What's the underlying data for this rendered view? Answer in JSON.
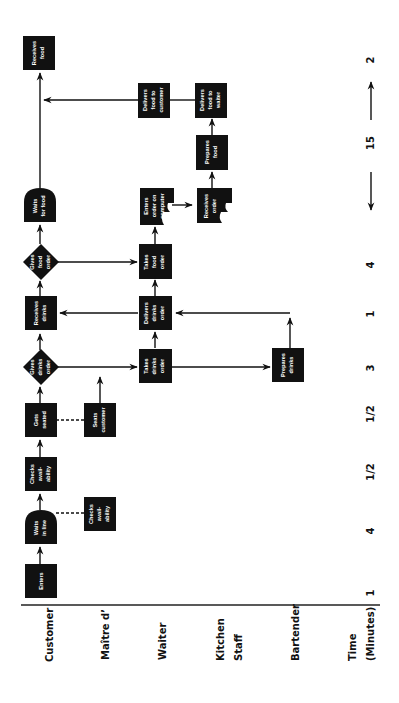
{
  "lanes": {
    "customer": "Customer",
    "maitre_d": "Maître d’",
    "waiter": "Waiter",
    "kitchen_line1": "Kitchen",
    "kitchen_line2": "Staff",
    "bartender": "Bartender",
    "time_line1": "Time",
    "time_line2": "(Minutes)"
  },
  "nodes": {
    "enters": [
      "Enters"
    ],
    "waits_in_line": [
      "Waits",
      "in line"
    ],
    "checks_availability_customer": [
      "Checks",
      "avail-",
      "ability"
    ],
    "checks_availability_maitre": [
      "Checks",
      "avail-",
      "ability"
    ],
    "gets_seated": [
      "Gets",
      "seated"
    ],
    "seats_customer": [
      "Seats",
      "customer"
    ],
    "gives_drinks_order": [
      "Gives",
      "drinks",
      "order"
    ],
    "takes_drinks_order": [
      "Takes",
      "drinks",
      "order"
    ],
    "prepares_drinks": [
      "Prepares",
      "drinks"
    ],
    "receives_drinks": [
      "Receives",
      "drinks"
    ],
    "delivers_drinks_order": [
      "Delivers",
      "drinks",
      "order"
    ],
    "gives_food_order": [
      "Gives",
      "food",
      "order"
    ],
    "takes_food_order": [
      "Takes",
      "food",
      "order"
    ],
    "waits_for_food": [
      "Waits",
      "for food"
    ],
    "enters_order_on_computer": [
      "Enters",
      "order on",
      "computer"
    ],
    "receives_order": [
      "Receives",
      "order"
    ],
    "prepares_food": [
      "Prepares",
      "food"
    ],
    "delivers_food_to_waiter": [
      "Delivers",
      "food to",
      "waiter"
    ],
    "delivers_food_to_customer": [
      "Delivers",
      "food to",
      "customer"
    ],
    "receives_food": [
      "Receives",
      "food"
    ]
  },
  "time": {
    "t1": "1",
    "t2": "4",
    "t3": "1/2",
    "t4": "1/2",
    "t5": "3",
    "t6": "1",
    "t7": "4",
    "t8": "15",
    "t9": "2"
  },
  "colors": {
    "node_fill": "#111111",
    "node_text": "#ffffff",
    "line": "#111111",
    "background": "#ffffff"
  }
}
